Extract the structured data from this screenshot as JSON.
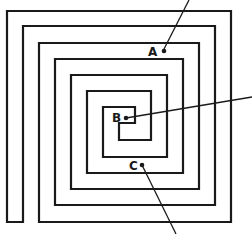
{
  "diagram": {
    "type": "square-spiral-maze",
    "stroke_color": "#1a1a1a",
    "background_color": "#ffffff",
    "points": [
      {
        "id": "A",
        "label": "A"
      },
      {
        "id": "B",
        "label": "B"
      },
      {
        "id": "C",
        "label": "C"
      }
    ]
  }
}
